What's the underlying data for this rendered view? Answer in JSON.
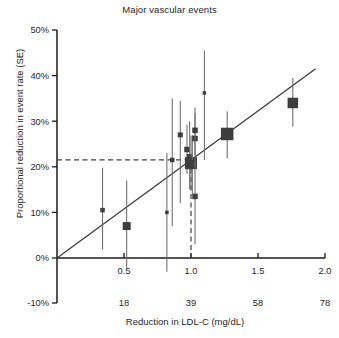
{
  "chart_data": {
    "type": "scatter",
    "title": "Major vascular events",
    "xlabel": "Reduction in LDL-C (mg/dL)",
    "ylabel": "Proportional reduction in event rate (SE)",
    "xlim": [
      0.0,
      2.0
    ],
    "ylim": [
      -0.1,
      0.5
    ],
    "grid": false,
    "legend": "none",
    "x_ticks_primary": [
      "0.5",
      "1.0",
      "1.5",
      "2.0"
    ],
    "x_tick_values_primary": [
      0.5,
      1.0,
      1.5,
      2.0
    ],
    "x_ticks_secondary": [
      "18",
      "39",
      "58",
      "78"
    ],
    "x_tick_values_secondary": [
      0.5,
      1.0,
      1.5,
      2.0
    ],
    "y_ticks": [
      "-10%",
      "0%",
      "10%",
      "20%",
      "30%",
      "40%",
      "50%"
    ],
    "y_tick_values": [
      -0.1,
      0.0,
      0.1,
      0.2,
      0.3,
      0.4,
      0.5
    ],
    "marker_color": "#3d3d3d",
    "line_color": "#3a3a3a",
    "errorbar_color": "#6b6b6b",
    "reference_line_style": "dashed",
    "reference_line_x": 1.0,
    "reference_line_y": 0.215,
    "fit_line": {
      "x0": 0.0,
      "y0": 0.0,
      "x1": 1.93,
      "y1": 0.415,
      "slope": 0.215,
      "intercept": 0.0
    },
    "points": [
      {
        "x": 0.34,
        "y": 0.105,
        "y_low": 0.018,
        "y_high": 0.198,
        "size": 4.5
      },
      {
        "x": 0.52,
        "y": 0.07,
        "y_low": -0.028,
        "y_high": 0.17,
        "size": 8.0
      },
      {
        "x": 0.82,
        "y": 0.1,
        "y_low": -0.03,
        "y_high": 0.23,
        "size": 3.5
      },
      {
        "x": 0.86,
        "y": 0.215,
        "y_low": 0.07,
        "y_high": 0.35,
        "size": 4.5
      },
      {
        "x": 0.92,
        "y": 0.27,
        "y_low": 0.12,
        "y_high": 0.345,
        "size": 5.0
      },
      {
        "x": 0.97,
        "y": 0.238,
        "y_low": 0.185,
        "y_high": 0.292,
        "size": 5.5
      },
      {
        "x": 0.99,
        "y": 0.222,
        "y_low": 0.15,
        "y_high": 0.3,
        "size": 5.5
      },
      {
        "x": 1.0,
        "y": 0.208,
        "y_low": 0.15,
        "y_high": 0.268,
        "size": 12.0
      },
      {
        "x": 1.01,
        "y": 0.205,
        "y_low": 0.14,
        "y_high": 0.27,
        "size": 9.0
      },
      {
        "x": 1.03,
        "y": 0.262,
        "y_low": 0.2,
        "y_high": 0.318,
        "size": 5.5
      },
      {
        "x": 1.03,
        "y": 0.28,
        "y_low": 0.225,
        "y_high": 0.33,
        "size": 5.5
      },
      {
        "x": 1.03,
        "y": 0.135,
        "y_low": 0.03,
        "y_high": 0.208,
        "size": 5.5
      },
      {
        "x": 1.1,
        "y": 0.362,
        "y_low": 0.215,
        "y_high": 0.455,
        "size": 3.5
      },
      {
        "x": 1.27,
        "y": 0.272,
        "y_low": 0.218,
        "y_high": 0.322,
        "size": 12.5
      },
      {
        "x": 1.76,
        "y": 0.34,
        "y_low": 0.288,
        "y_high": 0.395,
        "size": 10.5
      }
    ]
  },
  "axes": {
    "title": "Major vascular events",
    "x_axis_label": "Reduction in LDL-C (mg/dL)",
    "y_axis_label": "Proportional reduction in event rate (SE)"
  }
}
